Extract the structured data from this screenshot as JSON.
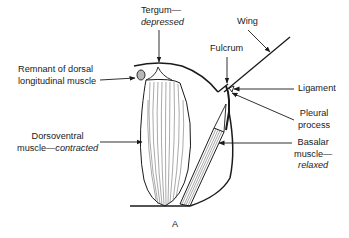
{
  "figure": {
    "panel_label": "A",
    "labels": {
      "tergum": {
        "line1": "Tergum—",
        "line2": "depressed"
      },
      "wing": "Wing",
      "fulcrum": "Fulcrum",
      "ligament": "Ligament",
      "pleural_process": {
        "line1": "Pleural",
        "line2": "process"
      },
      "basalar_muscle": {
        "line1": "Basalar",
        "line2": "muscle—",
        "line3": "relaxed"
      },
      "remnant": {
        "line1": "Remnant of dorsal",
        "line2": "longitudinal muscle"
      },
      "dorsoventral": {
        "line1": "Dorsoventral",
        "line2_plain": "muscle—",
        "line2_italic": "contracted"
      }
    },
    "colors": {
      "ink": "#1a1a1a",
      "background": "#ffffff"
    }
  }
}
